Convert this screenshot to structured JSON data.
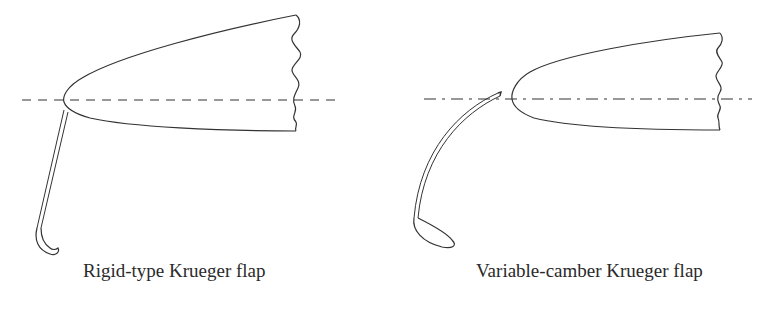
{
  "figure": {
    "panels": [
      {
        "id": "rigid",
        "caption": "Rigid-type Krueger flap",
        "elements": [
          "wing-leading-edge",
          "chord-line",
          "krueger-flap-rigid",
          "break-line"
        ]
      },
      {
        "id": "variable",
        "caption": "Variable-camber Krueger flap",
        "elements": [
          "wing-leading-edge",
          "chord-line",
          "krueger-flap-variable-camber",
          "break-line"
        ]
      }
    ],
    "colors": {
      "stroke": "#333333",
      "background": "#ffffff",
      "text": "#2a2a2a"
    }
  }
}
